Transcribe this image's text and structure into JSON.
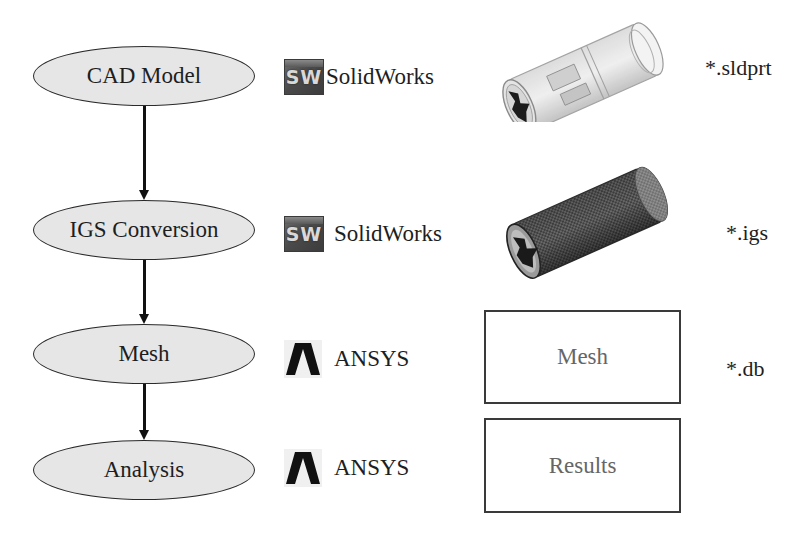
{
  "workflow": {
    "steps": [
      {
        "label": "CAD Model",
        "tool": "SolidWorks",
        "tool_icon": "solidworks-logo-icon",
        "output_type": "image",
        "output_desc": "translucent-cylinder-rendering",
        "extension": "*.sldprt"
      },
      {
        "label": "IGS Conversion",
        "tool": "SolidWorks",
        "tool_icon": "solidworks-logo-icon",
        "output_type": "image",
        "output_desc": "wireframe-cylinder-rendering",
        "extension": "*.igs"
      },
      {
        "label": "Mesh",
        "tool": "ANSYS",
        "tool_icon": "ansys-logo-icon",
        "output_type": "box",
        "output_label": "Mesh",
        "extension": "*.db"
      },
      {
        "label": "Analysis",
        "tool": "ANSYS",
        "tool_icon": "ansys-logo-icon",
        "output_type": "box",
        "output_label": "Results",
        "extension": ""
      }
    ]
  },
  "icons": {
    "solidworks_letters": "SW"
  },
  "colors": {
    "ellipse_fill": "#e6e6e6",
    "ellipse_stroke": "#2a2a2a",
    "arrow": "#111111",
    "box_text": "#666666",
    "text": "#1e1e1e"
  }
}
